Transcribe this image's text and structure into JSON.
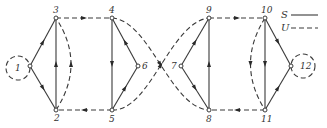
{
  "diagram": {
    "type": "directed network graph",
    "legend": {
      "items": [
        {
          "label": "S",
          "style": "solid"
        },
        {
          "label": "U",
          "style": "dashed"
        }
      ]
    },
    "nodes": [
      {
        "id": "1",
        "label": "1",
        "loop": "dashed"
      },
      {
        "id": "2",
        "label": "2"
      },
      {
        "id": "3",
        "label": "3"
      },
      {
        "id": "4",
        "label": "4"
      },
      {
        "id": "5",
        "label": "5"
      },
      {
        "id": "6",
        "label": "6"
      },
      {
        "id": "7",
        "label": "7"
      },
      {
        "id": "8",
        "label": "8"
      },
      {
        "id": "9",
        "label": "9"
      },
      {
        "id": "10",
        "label": "10"
      },
      {
        "id": "11",
        "label": "11"
      },
      {
        "id": "12",
        "label": "12",
        "loop": "dashed"
      }
    ],
    "edges": [
      {
        "from": "1",
        "to": "3",
        "style": "solid"
      },
      {
        "from": "1",
        "to": "2",
        "style": "solid"
      },
      {
        "from": "2",
        "to": "3",
        "style": "solid"
      },
      {
        "from": "2",
        "to": "3",
        "style": "dashed",
        "curved": true
      },
      {
        "from": "3",
        "to": "4",
        "style": "dashed"
      },
      {
        "from": "5",
        "to": "2",
        "style": "dashed"
      },
      {
        "from": "4",
        "to": "5",
        "style": "solid"
      },
      {
        "from": "6",
        "to": "4",
        "style": "solid"
      },
      {
        "from": "5",
        "to": "6",
        "style": "solid"
      },
      {
        "from": "4",
        "to": "8",
        "style": "dashed",
        "curved": true
      },
      {
        "from": "5",
        "to": "9",
        "style": "dashed",
        "curved": true
      },
      {
        "from": "7",
        "to": "9",
        "style": "solid"
      },
      {
        "from": "7",
        "to": "8",
        "style": "solid"
      },
      {
        "from": "8",
        "to": "9",
        "style": "solid"
      },
      {
        "from": "9",
        "to": "10",
        "style": "dashed"
      },
      {
        "from": "11",
        "to": "8",
        "style": "dashed"
      },
      {
        "from": "10",
        "to": "11",
        "style": "solid"
      },
      {
        "from": "10",
        "to": "11",
        "style": "dashed",
        "curved": true
      },
      {
        "from": "10",
        "to": "12",
        "style": "solid"
      },
      {
        "from": "11",
        "to": "12",
        "style": "solid"
      }
    ]
  }
}
